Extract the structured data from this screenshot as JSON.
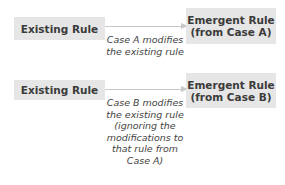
{
  "diagram": {
    "rows": [
      {
        "source": "Existing Rule",
        "target_lines": [
          "Emergent Rule",
          "(from Case A)"
        ],
        "caption_lines": [
          "Case A modifies",
          "the existing rule"
        ]
      },
      {
        "source": "Existing Rule",
        "target_lines": [
          "Emergent Rule",
          "(from Case B)"
        ],
        "caption_lines": [
          "Case B modifies",
          "the existing rule",
          "(ignoring the",
          "modifications to",
          "that rule from",
          "Case A)"
        ]
      }
    ],
    "colors": {
      "box_fill": "#e6e6e6",
      "arrow": "#c8c8c8",
      "text": "#3b3b3b"
    }
  }
}
